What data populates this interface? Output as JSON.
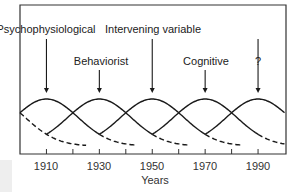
{
  "diagram": {
    "x_axis": {
      "title": "Years",
      "tick_labels": [
        "1910",
        "1930",
        "1950",
        "1970",
        "1990"
      ],
      "range": [
        1900,
        2000
      ],
      "minor_ticks": [
        1910,
        1920,
        1930,
        1940,
        1950,
        1960,
        1970,
        1980,
        1990
      ]
    },
    "paradigms": [
      {
        "label": "Psychophysiological",
        "peak_year": 1910
      },
      {
        "label": "Behaviorist",
        "peak_year": 1930
      },
      {
        "label": "Intervening variable",
        "peak_year": 1950
      },
      {
        "label": "Cognitive",
        "peak_year": 1970
      },
      {
        "label": "?",
        "peak_year": 1990
      }
    ],
    "colors": {
      "line": "#1a1a1a",
      "frame": "#333333",
      "background": "#ffffff"
    }
  }
}
